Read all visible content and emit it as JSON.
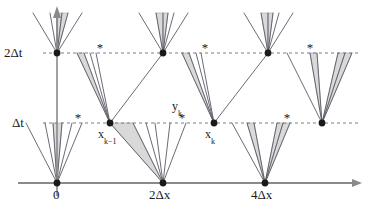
{
  "figure": {
    "type": "lattice-characteristics-diagram",
    "background": "#ffffff",
    "width": 377,
    "height": 214,
    "colors": {
      "axis": "#8a8a8a",
      "ray": "#5a5a66",
      "dashed_grid": "#6e6e78",
      "wedge_fill": "#d9d9d9",
      "wedge_stroke": "#a8a8a8",
      "node": "#1a1a1a",
      "text": "#1a1a1a"
    }
  },
  "axes": {
    "x_axis_label": "",
    "y_axis_label": "",
    "x_ticks": [
      {
        "name": "origin",
        "label": "0",
        "x": 57,
        "label_x": 53,
        "label_y": 188
      },
      {
        "name": "two-delta-x",
        "label": "2Δx",
        "x": 163,
        "label_x": 149,
        "label_y": 188
      },
      {
        "name": "four-delta-x",
        "label": "4Δx",
        "x": 265,
        "label_x": 251,
        "label_y": 188
      }
    ],
    "y_ticks": [
      {
        "name": "delta-t",
        "label": "Δt",
        "y": 123,
        "label_x": 12,
        "label_y": 116
      },
      {
        "name": "two-delta-t",
        "label": "2Δt",
        "y": 53,
        "label_x": 4,
        "label_y": 46
      }
    ]
  },
  "gridlines": [
    {
      "name": "delta-t-gridline",
      "y": 123,
      "x1": 43,
      "x2": 360,
      "style": "dashed"
    },
    {
      "name": "two-delta-t-gridline",
      "y": 53,
      "x1": 43,
      "x2": 360,
      "style": "dashed"
    }
  ],
  "node_labels": [
    {
      "name": "x-k-minus-1-label",
      "base": "x",
      "subscript": "k−1",
      "x": 98,
      "y": 128
    },
    {
      "name": "y-k-label",
      "base": "y",
      "subscript": "k",
      "x": 172,
      "y": 100
    },
    {
      "name": "x-k-label",
      "base": "x",
      "subscript": "k",
      "x": 205,
      "y": 128
    }
  ],
  "nodes": [
    {
      "name": "node-origin",
      "x": 57,
      "y": 183,
      "r": 3.4
    },
    {
      "name": "node-2dx",
      "x": 163,
      "y": 183,
      "r": 3.4
    },
    {
      "name": "node-4dx",
      "x": 265,
      "y": 183,
      "r": 3.4
    },
    {
      "name": "node-xk-minus-1",
      "x": 110,
      "y": 123,
      "r": 3.4
    },
    {
      "name": "node-xk",
      "x": 214,
      "y": 123,
      "r": 3.4
    },
    {
      "name": "node-dt-right",
      "x": 322,
      "y": 123,
      "r": 3.4
    },
    {
      "name": "node-2dt-0",
      "x": 57,
      "y": 53,
      "r": 3.4
    },
    {
      "name": "node-2dt-1",
      "x": 163,
      "y": 53,
      "r": 3.4
    },
    {
      "name": "node-2dt-2",
      "x": 268,
      "y": 53,
      "r": 3.4
    }
  ],
  "asterisks": [
    {
      "name": "asterisk-dt-1",
      "x": 78,
      "y": 122
    },
    {
      "name": "asterisk-dt-yk",
      "x": 182,
      "y": 122
    },
    {
      "name": "asterisk-dt-3",
      "x": 287,
      "y": 122
    },
    {
      "name": "asterisk-2dt-1",
      "x": 100,
      "y": 52
    },
    {
      "name": "asterisk-2dt-2",
      "x": 205,
      "y": 52
    },
    {
      "name": "asterisk-2dt-3",
      "x": 310,
      "y": 52
    }
  ],
  "fans": [
    {
      "name": "fan-origin-up",
      "apex_x": 57,
      "apex_y": 183,
      "top_y": 123,
      "rays": [
        26,
        45,
        53,
        62,
        72,
        82
      ],
      "wedges": [
        [
          53,
          62
        ]
      ]
    },
    {
      "name": "fan-2dx-up",
      "apex_x": 163,
      "apex_y": 183,
      "top_y": 123,
      "rays": [
        110,
        133,
        146,
        155,
        170,
        186
      ],
      "wedges": [
        [
          110,
          133
        ]
      ]
    },
    {
      "name": "fan-4dx-up",
      "apex_x": 265,
      "apex_y": 183,
      "top_y": 123,
      "rays": [
        232,
        247,
        254,
        277,
        283,
        290
      ],
      "wedges": [
        [
          247,
          254
        ],
        [
          277,
          283
        ],
        [
          283,
          290
        ]
      ]
    },
    {
      "name": "fan-xk-minus-1-up",
      "apex_x": 110,
      "apex_y": 123,
      "top_y": 53,
      "rays": [
        77,
        84,
        90,
        96,
        163
      ],
      "wedges": [
        [
          77,
          84
        ]
      ]
    },
    {
      "name": "fan-xk-up",
      "apex_x": 214,
      "apex_y": 123,
      "top_y": 53,
      "rays": [
        182,
        189,
        196,
        201,
        268
      ],
      "wedges": [
        [
          182,
          189
        ]
      ]
    },
    {
      "name": "fan-dt-right-up",
      "apex_x": 322,
      "apex_y": 123,
      "top_y": 53,
      "rays": [
        287,
        310,
        317,
        338,
        345,
        352
      ],
      "wedges": [
        [
          310,
          317
        ],
        [
          338,
          345
        ],
        [
          345,
          352
        ]
      ]
    },
    {
      "name": "fan-2dt-0-up",
      "apex_x": 57,
      "apex_y": 53,
      "top_y": 13,
      "rays": [
        33,
        50,
        57,
        62,
        68,
        82
      ],
      "wedges": [
        [
          57,
          62
        ],
        [
          62,
          68
        ]
      ]
    },
    {
      "name": "fan-2dt-1-up",
      "apex_x": 163,
      "apex_y": 53,
      "top_y": 13,
      "rays": [
        139,
        156,
        163,
        168,
        174,
        188
      ],
      "wedges": [
        [
          156,
          163
        ],
        [
          163,
          168
        ]
      ]
    },
    {
      "name": "fan-2dt-2-up",
      "apex_x": 268,
      "apex_y": 53,
      "top_y": 13,
      "rays": [
        244,
        261,
        268,
        273,
        279,
        293
      ],
      "wedges": [
        [
          261,
          268
        ],
        [
          268,
          273
        ]
      ]
    }
  ]
}
